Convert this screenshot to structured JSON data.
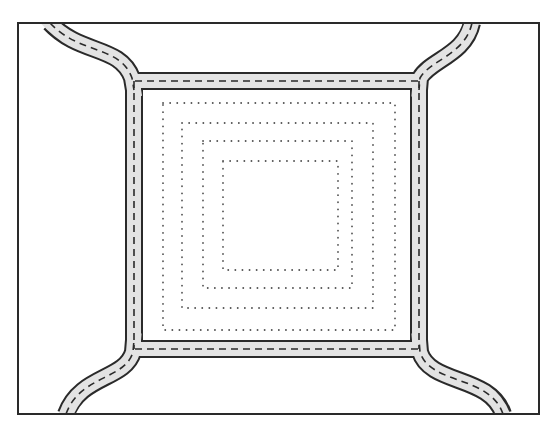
{
  "diagram": {
    "colors": {
      "background": "#ffffff",
      "ink": "#2a2a2a",
      "road_fill": "#e3e3e3",
      "dots": "#555555"
    },
    "frame": {
      "x1": 18,
      "y1": 23,
      "x2": 539,
      "y2": 414
    },
    "roads": {
      "width": 15,
      "top": {
        "x1": 135,
        "y1": 81,
        "x2": 419,
        "y2": 81
      },
      "bottom": {
        "x1": 135,
        "y1": 349,
        "x2": 419,
        "y2": 349
      },
      "left": {
        "x1": 134,
        "y1": 81,
        "x2": 134,
        "y2": 349
      },
      "right": {
        "x1": 419,
        "y1": 81,
        "x2": 419,
        "y2": 349
      },
      "curves": [
        {
          "name": "top-left",
          "d": "M 50 23 C 80 55, 120 45, 132 78 L 134 90"
        },
        {
          "name": "top-right",
          "d": "M 472 23 C 465 55, 430 60, 420 78 L 419 90"
        },
        {
          "name": "bottom-left",
          "d": "M 66 414 C 80 375, 125 380, 133 352 L 134 340"
        },
        {
          "name": "bottom-right",
          "d": "M 503 414 C 490 375, 430 385, 420 352 L 419 340"
        }
      ]
    },
    "dotted_squares": [
      {
        "x": 163,
        "y": 103,
        "w": 232,
        "h": 227
      },
      {
        "x": 182,
        "y": 123,
        "w": 191,
        "h": 185
      },
      {
        "x": 203,
        "y": 141,
        "w": 149,
        "h": 147
      },
      {
        "x": 223,
        "y": 161,
        "w": 115,
        "h": 109
      }
    ]
  }
}
